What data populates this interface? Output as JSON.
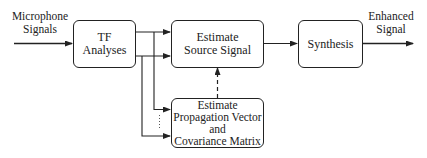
{
  "diagram": {
    "input_label": [
      "Microphone",
      "Signals"
    ],
    "output_label": [
      "Enhanced",
      "Signal"
    ],
    "blocks": [
      {
        "id": "tf",
        "lines": [
          "TF",
          "Analyses"
        ]
      },
      {
        "id": "ess",
        "lines": [
          "Estimate",
          "Source Signal"
        ]
      },
      {
        "id": "syn",
        "lines": [
          "Synthesis"
        ]
      },
      {
        "id": "prop",
        "lines": [
          "Estimate",
          "Propagation Vector",
          "and",
          "Covariance Matrix"
        ]
      }
    ],
    "edges": [
      {
        "from": "input",
        "to": "tf",
        "style": "solid"
      },
      {
        "from": "tf",
        "to": "ess",
        "style": "solid",
        "count": 2
      },
      {
        "from": "tf",
        "to": "prop",
        "style": "solid",
        "count": 2,
        "ellipsis": true
      },
      {
        "from": "prop",
        "to": "ess",
        "style": "dashed"
      },
      {
        "from": "ess",
        "to": "syn",
        "style": "solid"
      },
      {
        "from": "syn",
        "to": "output",
        "style": "solid"
      }
    ],
    "colors": {
      "stroke": "#222222",
      "background": "#ffffff"
    }
  }
}
